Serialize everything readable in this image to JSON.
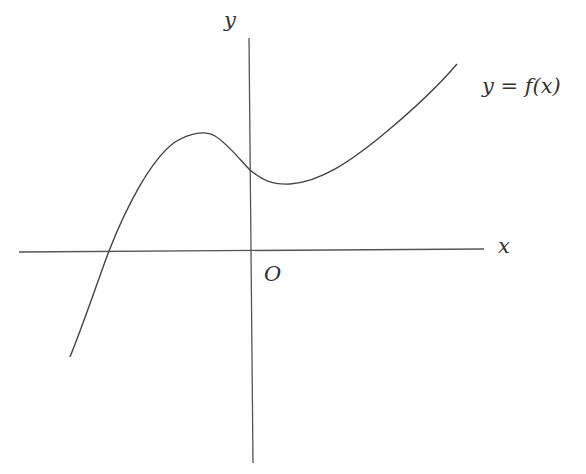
{
  "diagram": {
    "type": "function-graph",
    "labels": {
      "y_axis": "y",
      "x_axis": "x",
      "origin": "O",
      "curve": "y = f(x)"
    },
    "colors": {
      "stroke": "#444444",
      "text": "#333333",
      "background": "#ffffff"
    },
    "features": {
      "x_intercept": "one negative root",
      "local_max": "at x < 0, above x-axis",
      "cusp_at_y_axis": "curve meets y-axis at positive y with a corner",
      "local_min": "at x > 0, above x-axis",
      "end_behavior": "increasing to the right"
    }
  }
}
